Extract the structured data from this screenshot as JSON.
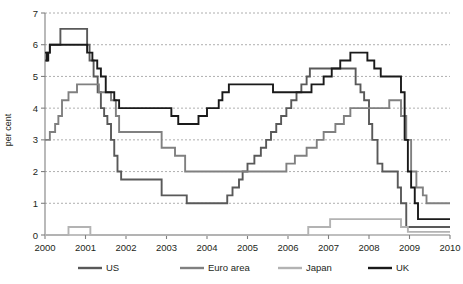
{
  "chart_data": {
    "type": "line",
    "title": "",
    "subtitle": "",
    "xlabel": "",
    "ylabel": "per cent",
    "xlim": [
      2000,
      2010
    ],
    "ylim": [
      0,
      7
    ],
    "grid": true,
    "line_style": "step",
    "legend_position": "bottom",
    "x_ticks": [
      "2000",
      "2001",
      "2002",
      "2003",
      "2004",
      "2005",
      "2006",
      "2007",
      "2008",
      "2009",
      "2010"
    ],
    "y_ticks": [
      "0",
      "1",
      "2",
      "3",
      "4",
      "5",
      "6",
      "7"
    ],
    "series": [
      {
        "name": "US",
        "color": "#595959",
        "points": [
          [
            2000.0,
            5.5
          ],
          [
            2000.05,
            5.75
          ],
          [
            2000.12,
            6.0
          ],
          [
            2000.38,
            6.5
          ],
          [
            2001.0,
            6.5
          ],
          [
            2001.04,
            6.0
          ],
          [
            2001.1,
            5.5
          ],
          [
            2001.2,
            5.0
          ],
          [
            2001.3,
            4.5
          ],
          [
            2001.38,
            4.0
          ],
          [
            2001.46,
            3.75
          ],
          [
            2001.54,
            3.5
          ],
          [
            2001.63,
            3.0
          ],
          [
            2001.71,
            2.5
          ],
          [
            2001.79,
            2.0
          ],
          [
            2001.88,
            1.75
          ],
          [
            2002.0,
            1.75
          ],
          [
            2002.88,
            1.25
          ],
          [
            2003.5,
            1.0
          ],
          [
            2004.5,
            1.25
          ],
          [
            2004.63,
            1.5
          ],
          [
            2004.79,
            1.75
          ],
          [
            2004.88,
            2.0
          ],
          [
            2005.0,
            2.25
          ],
          [
            2005.17,
            2.5
          ],
          [
            2005.33,
            2.75
          ],
          [
            2005.46,
            3.0
          ],
          [
            2005.58,
            3.25
          ],
          [
            2005.71,
            3.5
          ],
          [
            2005.83,
            3.75
          ],
          [
            2005.96,
            4.0
          ],
          [
            2006.08,
            4.25
          ],
          [
            2006.21,
            4.5
          ],
          [
            2006.33,
            4.75
          ],
          [
            2006.46,
            5.0
          ],
          [
            2006.54,
            5.25
          ],
          [
            2007.67,
            4.75
          ],
          [
            2007.79,
            4.5
          ],
          [
            2007.88,
            4.25
          ],
          [
            2008.0,
            3.5
          ],
          [
            2008.08,
            3.0
          ],
          [
            2008.21,
            2.25
          ],
          [
            2008.33,
            2.0
          ],
          [
            2008.71,
            1.5
          ],
          [
            2008.79,
            1.0
          ],
          [
            2008.92,
            0.25
          ],
          [
            2010.0,
            0.25
          ]
        ]
      },
      {
        "name": "Euro area",
        "color": "#808080",
        "points": [
          [
            2000.0,
            3.0
          ],
          [
            2000.12,
            3.25
          ],
          [
            2000.25,
            3.5
          ],
          [
            2000.33,
            3.75
          ],
          [
            2000.42,
            4.25
          ],
          [
            2000.58,
            4.5
          ],
          [
            2000.79,
            4.75
          ],
          [
            2001.33,
            4.5
          ],
          [
            2001.63,
            4.25
          ],
          [
            2001.75,
            3.75
          ],
          [
            2001.83,
            3.25
          ],
          [
            2002.0,
            3.25
          ],
          [
            2002.88,
            2.75
          ],
          [
            2003.21,
            2.5
          ],
          [
            2003.46,
            2.0
          ],
          [
            2005.96,
            2.25
          ],
          [
            2006.17,
            2.5
          ],
          [
            2006.46,
            2.75
          ],
          [
            2006.71,
            3.0
          ],
          [
            2006.88,
            3.25
          ],
          [
            2007.17,
            3.5
          ],
          [
            2007.38,
            3.75
          ],
          [
            2007.54,
            4.0
          ],
          [
            2008.5,
            4.25
          ],
          [
            2008.79,
            3.75
          ],
          [
            2008.92,
            3.0
          ],
          [
            2009.04,
            2.0
          ],
          [
            2009.17,
            1.5
          ],
          [
            2009.33,
            1.25
          ],
          [
            2009.42,
            1.0
          ],
          [
            2010.0,
            1.0
          ]
        ]
      },
      {
        "name": "Japan",
        "color": "#b3b3b3",
        "points": [
          [
            2000.0,
            0.0
          ],
          [
            2000.58,
            0.25
          ],
          [
            2001.12,
            0.0
          ],
          [
            2006.5,
            0.25
          ],
          [
            2007.04,
            0.5
          ],
          [
            2008.79,
            0.25
          ],
          [
            2008.96,
            0.1
          ],
          [
            2010.0,
            0.1
          ]
        ]
      },
      {
        "name": "UK",
        "color": "#1a1a1a",
        "points": [
          [
            2000.0,
            5.75
          ],
          [
            2000.04,
            5.5
          ],
          [
            2000.08,
            5.75
          ],
          [
            2000.12,
            6.0
          ],
          [
            2001.04,
            5.75
          ],
          [
            2001.17,
            5.5
          ],
          [
            2001.29,
            5.25
          ],
          [
            2001.38,
            5.0
          ],
          [
            2001.5,
            4.5
          ],
          [
            2001.71,
            4.25
          ],
          [
            2001.83,
            4.0
          ],
          [
            2003.12,
            3.75
          ],
          [
            2003.29,
            3.5
          ],
          [
            2003.79,
            3.75
          ],
          [
            2004.0,
            4.0
          ],
          [
            2004.29,
            4.25
          ],
          [
            2004.38,
            4.5
          ],
          [
            2004.54,
            4.75
          ],
          [
            2005.63,
            4.5
          ],
          [
            2006.58,
            4.75
          ],
          [
            2006.88,
            5.0
          ],
          [
            2007.08,
            5.25
          ],
          [
            2007.29,
            5.5
          ],
          [
            2007.54,
            5.75
          ],
          [
            2007.96,
            5.5
          ],
          [
            2008.13,
            5.25
          ],
          [
            2008.29,
            5.0
          ],
          [
            2008.79,
            4.5
          ],
          [
            2008.88,
            3.0
          ],
          [
            2008.96,
            2.0
          ],
          [
            2009.04,
            1.5
          ],
          [
            2009.13,
            1.0
          ],
          [
            2009.21,
            0.5
          ],
          [
            2010.0,
            0.5
          ]
        ]
      }
    ]
  },
  "legend": {
    "items": [
      {
        "label": "US",
        "color": "#595959"
      },
      {
        "label": "Euro area",
        "color": "#808080"
      },
      {
        "label": "Japan",
        "color": "#b3b3b3"
      },
      {
        "label": "UK",
        "color": "#1a1a1a"
      }
    ]
  },
  "axis": {
    "y_title": "per cent",
    "axis_color": "#808080",
    "grid_color": "#9a9a9a"
  }
}
